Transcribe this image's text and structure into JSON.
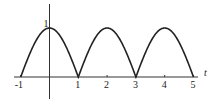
{
  "chart_data": {
    "type": "line",
    "title": "",
    "function": "|cos(pi*t/2)|",
    "xlabel": "t",
    "ylabel": "",
    "xlim": [
      -1,
      5
    ],
    "ylim": [
      0,
      1
    ],
    "x_ticks": [
      -1,
      1,
      2,
      3,
      4,
      5
    ],
    "x_tick_labels": [
      "-1",
      "1",
      "2",
      "3",
      "4",
      "5"
    ],
    "y_ticks": [
      1
    ],
    "y_tick_labels": [
      "1"
    ],
    "grid": false,
    "legend": null,
    "series": [
      {
        "name": "rectified cosine",
        "x": [
          -1,
          -0.5,
          0,
          0.5,
          1,
          1.5,
          2,
          2.5,
          3,
          3.5,
          4,
          4.5,
          5
        ],
        "values": [
          0,
          0.707,
          1,
          0.707,
          0,
          0.707,
          1,
          0.707,
          0,
          0.707,
          1,
          0.707,
          0
        ]
      }
    ],
    "colors": {
      "line": "#222222",
      "axis": "#333333"
    }
  }
}
